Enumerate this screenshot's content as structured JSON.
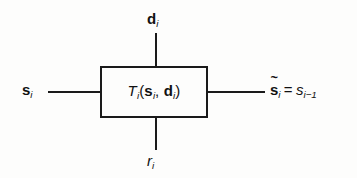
{
  "diagram": {
    "block": {
      "name": "transition-function-block",
      "label_parts": {
        "function": "T",
        "function_sub": "i",
        "open_paren": "(",
        "arg1": "s",
        "arg1_sub": "i",
        "comma": ",",
        "arg2": "d",
        "arg2_sub": "i",
        "close_paren": ")"
      },
      "label_plain": "T_i(s_i, d_i)"
    },
    "ports": {
      "top": {
        "name": "input-d",
        "symbol": "d",
        "subscript": "i",
        "plain": "d_i"
      },
      "bottom": {
        "name": "input-r",
        "symbol": "r",
        "subscript": "i",
        "plain": "r_i"
      },
      "left": {
        "name": "input-s",
        "symbol": "s",
        "subscript": "i",
        "plain": "s_i"
      },
      "right": {
        "name": "output-s-tilde",
        "symbol": "s",
        "accent": "~",
        "subscript": "i",
        "equals": "=",
        "result_symbol": "s",
        "result_subscript": "i−1",
        "plain": "s̃_i = s_{i-1}"
      }
    },
    "colors": {
      "stroke": "#1a1a1a",
      "text": "#111111",
      "background": "#fdfdfc"
    }
  }
}
